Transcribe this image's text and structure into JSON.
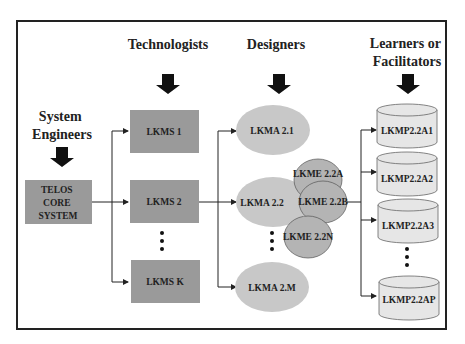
{
  "roles": {
    "system_engineers": [
      "System",
      "Engineers"
    ],
    "technologists": "Technologists",
    "designers": "Designers",
    "learners": [
      "Learners or",
      "Facilitators"
    ]
  },
  "core": [
    "TELOS",
    "CORE",
    "SYSTEM"
  ],
  "lkms": [
    "LKMS 1",
    "LKMS 2",
    "LKMS K"
  ],
  "lkma": [
    "LKMA 2.1",
    "LKMA 2.2",
    "LKMA 2.M"
  ],
  "lkme": [
    "LKME 2.2A",
    "LKME 2.2B",
    "LKME 2.2N"
  ],
  "lkmp": [
    "LKMP2.2A1",
    "LKMP2.2A2",
    "LKMP2.2A3",
    "LKMP2.2AP"
  ],
  "colors": {
    "box_fill": "#9a9a9a",
    "ellipse_fill": "#c8c8c8",
    "ellipse_dark_fill": "#b4b4b4",
    "cylinder_fill": "#e6e6e6",
    "stroke": "#222222"
  }
}
